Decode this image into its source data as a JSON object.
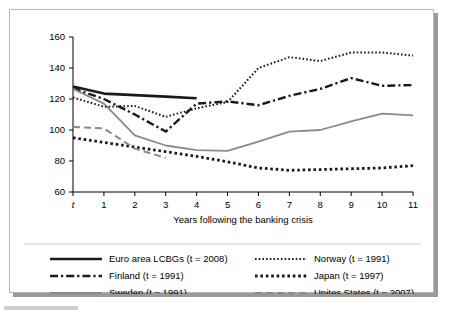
{
  "chart_data": {
    "type": "line",
    "title": "",
    "xlabel": "Years following the banking crisis",
    "ylabel": "",
    "x": [
      "t",
      "1",
      "2",
      "3",
      "4",
      "5",
      "6",
      "7",
      "8",
      "9",
      "10",
      "11"
    ],
    "xticklabels": [
      "t",
      "1",
      "2",
      "3",
      "4",
      "5",
      "6",
      "7",
      "8",
      "9",
      "10",
      "11"
    ],
    "yticklabels": [
      "60",
      "80",
      "100",
      "120",
      "140",
      "160"
    ],
    "yticks": [
      60,
      80,
      100,
      120,
      140,
      160
    ],
    "ylim": [
      60,
      160
    ],
    "grid": false,
    "legend_position": "bottom",
    "series": [
      {
        "name": "Euro area LCBGs (t = 2008)",
        "style": "solid",
        "color": "#1a1a1a",
        "width": 2.6,
        "values": [
          128,
          123.5,
          122.5,
          121.5,
          120.5,
          null,
          null,
          null,
          null,
          null,
          null,
          null
        ]
      },
      {
        "name": "Finland (t = 1991)",
        "style": "dash-dot",
        "color": "#1a1a1a",
        "width": 2.4,
        "values": [
          127,
          120,
          110,
          99,
          117,
          118.5,
          116,
          122,
          126.5,
          133.5,
          128.5,
          129
        ]
      },
      {
        "name": "Sweden (t = 1991)",
        "style": "solid",
        "color": "#8a8a8a",
        "width": 1.8,
        "values": [
          126.5,
          117,
          96.5,
          90,
          87,
          86.5,
          92.5,
          99,
          100,
          105.5,
          110.5,
          109.5
        ]
      },
      {
        "name": "Norway (t = 1991)",
        "style": "fine-dotted",
        "color": "#1a1a1a",
        "width": 2.0,
        "values": [
          121,
          115,
          115.5,
          108.5,
          114,
          118,
          140,
          147,
          144.5,
          150,
          150,
          148
        ]
      },
      {
        "name": "Japan (t = 1997)",
        "style": "thick-dotted",
        "color": "#1a1a1a",
        "width": 2.8,
        "values": [
          95,
          92,
          89,
          86,
          83,
          79.5,
          75.5,
          74,
          74.5,
          75,
          75.5,
          77
        ]
      },
      {
        "name": "Unites States (t = 2007)",
        "style": "dashed",
        "color": "#8a8a8a",
        "width": 2.0,
        "values": [
          102,
          101,
          88,
          82,
          null,
          null,
          null,
          null,
          null,
          null,
          null,
          null
        ]
      }
    ]
  },
  "legend": {
    "items": [
      {
        "label": "Euro area LCBGs (t = 2008)",
        "series": 0
      },
      {
        "label": "Finland (t = 1991)",
        "series": 1
      },
      {
        "label": "Sweden (t = 1991)",
        "series": 2
      },
      {
        "label": "Norway (t = 1991)",
        "series": 3
      },
      {
        "label": "Japan (t = 1997)",
        "series": 4
      },
      {
        "label": "Unites States (t = 2007)",
        "series": 5
      }
    ]
  }
}
